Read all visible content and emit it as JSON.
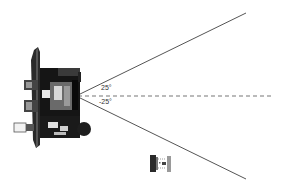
{
  "diagram": {
    "type": "robot-sensor-field-of-view",
    "apex": {
      "x": 76,
      "y": 96
    },
    "angles": {
      "upper_label": "25°",
      "lower_label": "-25°"
    },
    "boundary_lines": {
      "upper_end": {
        "x": 246,
        "y": 13
      },
      "lower_end": {
        "x": 246,
        "y": 179
      },
      "color": "#555555"
    },
    "center_line": {
      "style": "dashed",
      "end_x": 272,
      "color": "#777777"
    },
    "robot_large": {
      "label": "robot-top-view"
    },
    "robot_small": {
      "label": "robot-icon-small"
    }
  }
}
